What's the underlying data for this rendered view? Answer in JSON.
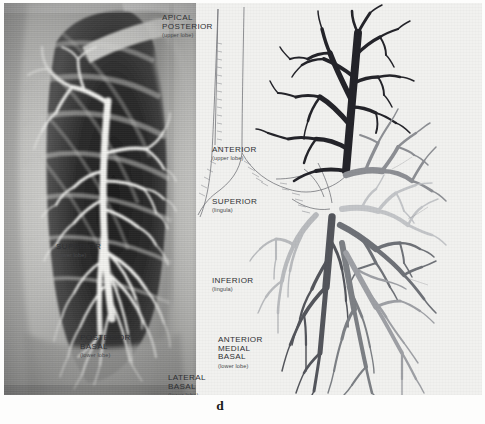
{
  "figure": {
    "caption": "d",
    "panels": {
      "xray": {
        "name": "bronchogram-radiograph",
        "description": "Chest radiograph bronchogram showing contrast-filled bronchial tree of left lung"
      },
      "diagram": {
        "name": "bronchial-tree-diagram",
        "description": "Line drawing of left bronchial tree with shaded bronchopulmonary segments"
      }
    }
  },
  "labels": [
    {
      "id": "apical-posterior",
      "name": "APICAL\nPOSTERIOR",
      "line1": "APICAL",
      "line2": "POSTERIOR",
      "lobe": "(upper lobe)",
      "x": 354,
      "y": 14
    },
    {
      "id": "anterior-upper",
      "line1": "ANTERIOR",
      "line2": "",
      "lobe": "(upper lobe)",
      "x": 404,
      "y": 146
    },
    {
      "id": "superior-lingula",
      "line1": "SUPERIOR",
      "line2": "",
      "lobe": "(lingula)",
      "x": 404,
      "y": 198
    },
    {
      "id": "superior-lower",
      "line1": "SUPERIOR",
      "line2": "",
      "lobe": "(lower lobe)",
      "x": 248,
      "y": 243
    },
    {
      "id": "inferior-lingula",
      "line1": "INFERIOR",
      "line2": "",
      "lobe": "(lingula)",
      "x": 404,
      "y": 277
    },
    {
      "id": "posterior-basal",
      "line1": "POSTERIOR",
      "line2": "BASAL",
      "lobe": "(lower lobe)",
      "x": 272,
      "y": 334
    },
    {
      "id": "anterior-medial-basal",
      "line1": "ANTERIOR",
      "line2": "MEDIAL",
      "line3": "BASAL",
      "lobe": "(lower lobe)",
      "x": 410,
      "y": 336
    },
    {
      "id": "lateral-basal",
      "line1": "LATERAL",
      "line2": "BASAL",
      "lobe": "(lower lobe)",
      "x": 360,
      "y": 374
    }
  ],
  "colors": {
    "paper": "#f1f1ef",
    "ink": "#2f3033",
    "apical_posterior": "#24242a",
    "anterior_upper": "#8d8f94",
    "superior_lingula": "#c3c5c8",
    "superior_lower": "#b9bbbe",
    "inferior_lingula": "#6f7278",
    "posterior_basal": "#54565c",
    "anterior_medial_basal": "#9ea0a5",
    "lateral_basal": "#7d8085",
    "outline": "#6d6f74",
    "xray_background": "#cfcfcd",
    "xray_lung": "#2b2b2b",
    "xray_contrast": "#f3f3f0"
  }
}
